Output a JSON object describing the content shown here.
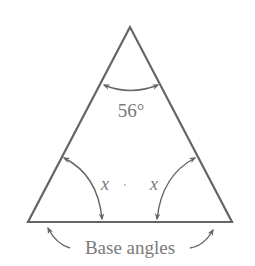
{
  "diagram": {
    "type": "isosceles-triangle",
    "colors": {
      "line": "#656565",
      "text": "#7a7a7a",
      "background": "#ffffff"
    },
    "vertices": {
      "apex": [
        130,
        27
      ],
      "base_left": [
        28,
        222
      ],
      "base_right": [
        232,
        222
      ]
    },
    "labels": {
      "apex_angle": "56°",
      "left_base_angle": "x",
      "right_base_angle": "x",
      "base_caption": "Base angles"
    }
  }
}
